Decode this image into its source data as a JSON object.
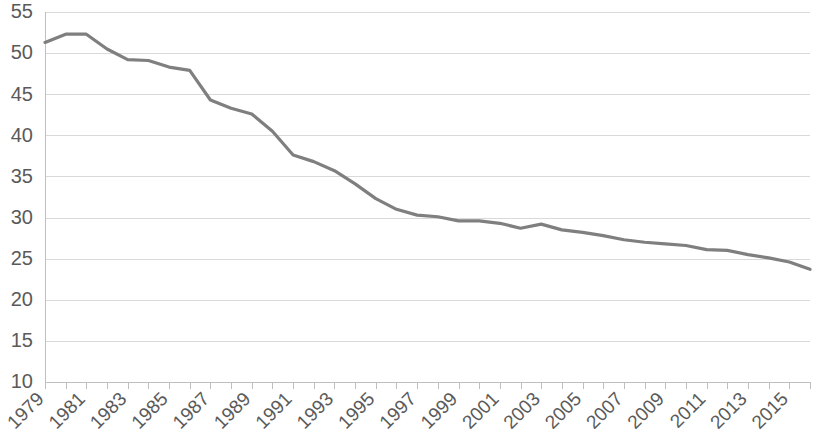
{
  "chart_data": {
    "type": "line",
    "title": "",
    "subtitle": "",
    "xlabel": "",
    "ylabel": "",
    "grid": true,
    "legend": false,
    "legend_position": "none",
    "line_color": "#7f7f7f",
    "axis_text_color": "#5a5a5a",
    "gridline_color": "#d9d9d9",
    "axis_line_color": "#bfbfbf",
    "background_color": "#ffffff",
    "xlim": [
      1979,
      2016
    ],
    "ylim": [
      10,
      55
    ],
    "y_tick_interval": 5,
    "x_tick_interval": 1,
    "x_label_interval": 2,
    "yticks": [
      10,
      15,
      20,
      25,
      30,
      35,
      40,
      45,
      50,
      55
    ],
    "ytick_labels": [
      "10",
      "15",
      "20",
      "25",
      "30",
      "35",
      "40",
      "45",
      "50",
      "55"
    ],
    "xticks": [
      1979,
      1980,
      1981,
      1982,
      1983,
      1984,
      1985,
      1986,
      1987,
      1988,
      1989,
      1990,
      1991,
      1992,
      1993,
      1994,
      1995,
      1996,
      1997,
      1998,
      1999,
      2000,
      2001,
      2002,
      2003,
      2004,
      2005,
      2006,
      2007,
      2008,
      2009,
      2010,
      2011,
      2012,
      2013,
      2014,
      2015,
      2016
    ],
    "xtick_labels": [
      "1979",
      "1981",
      "1983",
      "1985",
      "1987",
      "1989",
      "1991",
      "1993",
      "1995",
      "1997",
      "1999",
      "2001",
      "2003",
      "2005",
      "2007",
      "2009",
      "2011",
      "2013",
      "2015"
    ],
    "xtick_label_rotation": -45,
    "x": [
      1979,
      1980,
      1981,
      1982,
      1983,
      1984,
      1985,
      1986,
      1987,
      1988,
      1989,
      1990,
      1991,
      1992,
      1993,
      1994,
      1995,
      1996,
      1997,
      1998,
      1999,
      2000,
      2001,
      2002,
      2003,
      2004,
      2005,
      2006,
      2007,
      2008,
      2009,
      2010,
      2011,
      2012,
      2013,
      2014,
      2015,
      2016
    ],
    "values": [
      51.3,
      52.3,
      52.3,
      50.5,
      49.2,
      49.1,
      48.3,
      47.9,
      44.3,
      43.3,
      42.6,
      40.5,
      37.6,
      36.8,
      35.7,
      34.1,
      32.3,
      31.0,
      30.3,
      30.1,
      29.6,
      29.6,
      29.3,
      28.7,
      29.2,
      28.5,
      28.2,
      27.8,
      27.3,
      27.0,
      26.8,
      26.6,
      26.1,
      26.0,
      25.5,
      25.1,
      24.6,
      23.7
    ],
    "series": [
      {
        "name": "Series 1",
        "color": "#7f7f7f",
        "values": [
          51.3,
          52.3,
          52.3,
          50.5,
          49.2,
          49.1,
          48.3,
          47.9,
          44.3,
          43.3,
          42.6,
          40.5,
          37.6,
          36.8,
          35.7,
          34.1,
          32.3,
          31.0,
          30.3,
          30.1,
          29.6,
          29.6,
          29.3,
          28.7,
          29.2,
          28.5,
          28.2,
          27.8,
          27.3,
          27.0,
          26.8,
          26.6,
          26.1,
          26.0,
          25.5,
          25.1,
          24.6,
          23.7
        ]
      }
    ],
    "annotations": []
  }
}
